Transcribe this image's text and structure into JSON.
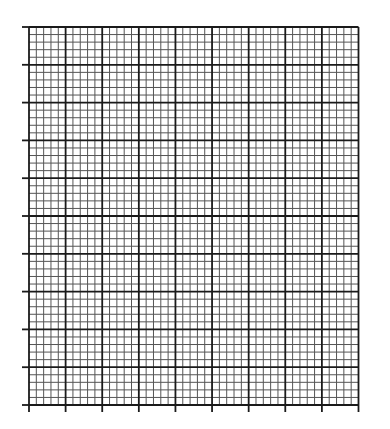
{
  "sheet": {
    "kind": "graph-paper",
    "major_columns": 9,
    "major_rows": 10,
    "minor_per_major": 5,
    "colors": {
      "background": "#ffffff",
      "major_line": "#1a1a1a",
      "minor_line": "#555555"
    }
  }
}
